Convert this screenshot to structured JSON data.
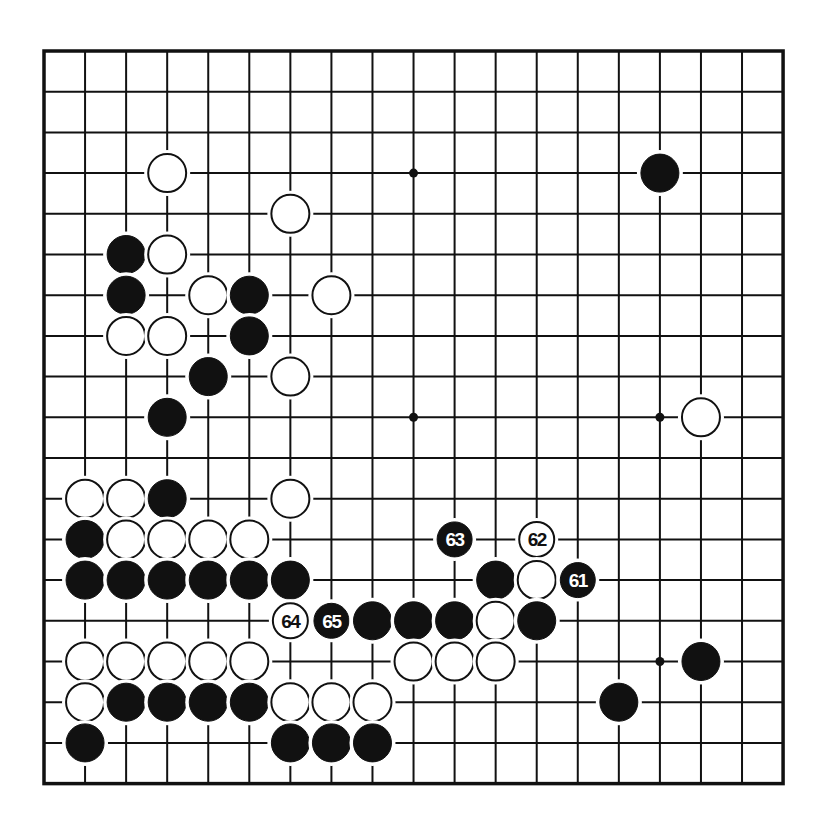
{
  "board": {
    "size": 19,
    "origin_x": 44,
    "origin_y": 51,
    "spacing_x": 41.06,
    "spacing_y": 40.7,
    "line_color": "#111111",
    "background": "#ffffff",
    "star_points": [
      [
        3,
        3
      ],
      [
        3,
        9
      ],
      [
        3,
        15
      ],
      [
        9,
        3
      ],
      [
        9,
        9
      ],
      [
        9,
        15
      ],
      [
        15,
        3
      ],
      [
        15,
        9
      ],
      [
        15,
        15
      ]
    ]
  },
  "colors": {
    "black_stone": "#111111",
    "white_stone": "#ffffff",
    "stone_outline": "#111111",
    "label_on_black": "#ffffff",
    "label_on_white": "#111111"
  },
  "stones": [
    {
      "color": "black",
      "row": 3,
      "col": 15
    },
    {
      "color": "white",
      "row": 3,
      "col": 3
    },
    {
      "color": "white",
      "row": 4,
      "col": 6
    },
    {
      "color": "black",
      "row": 5,
      "col": 2
    },
    {
      "color": "white",
      "row": 5,
      "col": 3
    },
    {
      "color": "black",
      "row": 6,
      "col": 2
    },
    {
      "color": "white",
      "row": 6,
      "col": 4
    },
    {
      "color": "black",
      "row": 6,
      "col": 5
    },
    {
      "color": "white",
      "row": 6,
      "col": 7
    },
    {
      "color": "white",
      "row": 7,
      "col": 2
    },
    {
      "color": "white",
      "row": 7,
      "col": 3
    },
    {
      "color": "black",
      "row": 7,
      "col": 5
    },
    {
      "color": "black",
      "row": 8,
      "col": 4
    },
    {
      "color": "white",
      "row": 8,
      "col": 6
    },
    {
      "color": "black",
      "row": 9,
      "col": 3
    },
    {
      "color": "white",
      "row": 9,
      "col": 16
    },
    {
      "color": "white",
      "row": 11,
      "col": 1
    },
    {
      "color": "white",
      "row": 11,
      "col": 2
    },
    {
      "color": "black",
      "row": 11,
      "col": 3
    },
    {
      "color": "white",
      "row": 11,
      "col": 6
    },
    {
      "color": "black",
      "row": 12,
      "col": 1
    },
    {
      "color": "white",
      "row": 12,
      "col": 2
    },
    {
      "color": "white",
      "row": 12,
      "col": 3
    },
    {
      "color": "white",
      "row": 12,
      "col": 4
    },
    {
      "color": "white",
      "row": 12,
      "col": 5
    },
    {
      "color": "black",
      "row": 12,
      "col": 10,
      "label": "63"
    },
    {
      "color": "white",
      "row": 12,
      "col": 12,
      "label": "62"
    },
    {
      "color": "black",
      "row": 13,
      "col": 1
    },
    {
      "color": "black",
      "row": 13,
      "col": 2
    },
    {
      "color": "black",
      "row": 13,
      "col": 3
    },
    {
      "color": "black",
      "row": 13,
      "col": 4
    },
    {
      "color": "black",
      "row": 13,
      "col": 5
    },
    {
      "color": "black",
      "row": 13,
      "col": 6
    },
    {
      "color": "black",
      "row": 13,
      "col": 11
    },
    {
      "color": "white",
      "row": 13,
      "col": 12
    },
    {
      "color": "black",
      "row": 13,
      "col": 13,
      "label": "61"
    },
    {
      "color": "white",
      "row": 14,
      "col": 6,
      "label": "64"
    },
    {
      "color": "black",
      "row": 14,
      "col": 7,
      "label": "65"
    },
    {
      "color": "black",
      "row": 14,
      "col": 8
    },
    {
      "color": "black",
      "row": 14,
      "col": 9
    },
    {
      "color": "black",
      "row": 14,
      "col": 10
    },
    {
      "color": "white",
      "row": 14,
      "col": 11
    },
    {
      "color": "black",
      "row": 14,
      "col": 12
    },
    {
      "color": "white",
      "row": 15,
      "col": 1
    },
    {
      "color": "white",
      "row": 15,
      "col": 2
    },
    {
      "color": "white",
      "row": 15,
      "col": 3
    },
    {
      "color": "white",
      "row": 15,
      "col": 4
    },
    {
      "color": "white",
      "row": 15,
      "col": 5
    },
    {
      "color": "white",
      "row": 15,
      "col": 9
    },
    {
      "color": "white",
      "row": 15,
      "col": 10
    },
    {
      "color": "white",
      "row": 15,
      "col": 11
    },
    {
      "color": "black",
      "row": 15,
      "col": 16
    },
    {
      "color": "white",
      "row": 16,
      "col": 1
    },
    {
      "color": "black",
      "row": 16,
      "col": 2
    },
    {
      "color": "black",
      "row": 16,
      "col": 3
    },
    {
      "color": "black",
      "row": 16,
      "col": 4
    },
    {
      "color": "black",
      "row": 16,
      "col": 5
    },
    {
      "color": "white",
      "row": 16,
      "col": 6
    },
    {
      "color": "white",
      "row": 16,
      "col": 7
    },
    {
      "color": "white",
      "row": 16,
      "col": 8
    },
    {
      "color": "black",
      "row": 16,
      "col": 14
    },
    {
      "color": "black",
      "row": 17,
      "col": 1
    },
    {
      "color": "black",
      "row": 17,
      "col": 6
    },
    {
      "color": "black",
      "row": 17,
      "col": 7
    },
    {
      "color": "black",
      "row": 17,
      "col": 8
    }
  ],
  "move_labels": [
    "61",
    "62",
    "63",
    "64",
    "65"
  ]
}
